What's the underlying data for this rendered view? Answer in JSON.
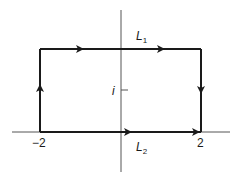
{
  "diagram": {
    "type": "contour-plot",
    "colors": {
      "line": "#1a1a1a",
      "axis": "#555555",
      "background": "#ffffff"
    },
    "axes": {
      "real_axis": {
        "x1": 12,
        "x2": 230,
        "y": 132
      },
      "imag_axis": {
        "x": 121,
        "y1": 10,
        "y2": 172
      }
    },
    "contour": {
      "left_x": 40,
      "right_x": 201,
      "top_y": 49,
      "bottom_y": 132,
      "direction": "clockwise-top-right-then-down-bottom-right"
    },
    "labels": {
      "L1": {
        "main": "L",
        "sub": "1"
      },
      "L2": {
        "main": "L",
        "sub": "2"
      },
      "tick_i": "i",
      "tick_neg2": "−2",
      "tick_2": "2"
    },
    "arrows": [
      {
        "edge": "top",
        "x": 82,
        "y": 49,
        "dir": "right"
      },
      {
        "edge": "top",
        "x": 163,
        "y": 49,
        "dir": "right"
      },
      {
        "edge": "right",
        "x": 201,
        "y": 92,
        "dir": "down"
      },
      {
        "edge": "left",
        "x": 40,
        "y": 88,
        "dir": "up"
      },
      {
        "edge": "bottom",
        "x": 130,
        "y": 132,
        "dir": "right"
      },
      {
        "edge": "bottom",
        "x": 198,
        "y": 132,
        "dir": "right"
      }
    ]
  }
}
